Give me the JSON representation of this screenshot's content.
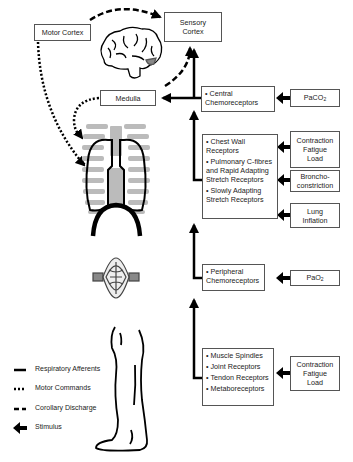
{
  "nodes": {
    "motor_cortex": "Motor Cortex",
    "sensory_cortex": [
      "Sensory",
      "Cortex"
    ],
    "medulla": "Medulla",
    "central_chemoreceptors": [
      "• Central",
      "Chemoreceptors"
    ],
    "paco2": {
      "base": "PaCO",
      "sub": "2"
    },
    "pulmonary_receptors": [
      "• Chest Wall Receptors",
      "• Pulmonary C-fibres and Rapid Adapting Stretch Receptors",
      "• Slowly Adapting Stretch Receptors"
    ],
    "stim_contraction_1": [
      "Contraction",
      "Fatigue",
      "Load"
    ],
    "stim_bronchoconstriction": [
      "Broncho-",
      "constriction"
    ],
    "stim_lung_inflation": [
      "Lung",
      "Inflation"
    ],
    "peripheral_chemoreceptors": [
      "• Peripheral",
      "Chemoreceptors"
    ],
    "pao2": {
      "base": "PaO",
      "sub": "2"
    },
    "muscle_receptors": [
      "• Muscle Spindles",
      "• Joint Receptors",
      "• Tendon Receptors",
      "• Metaboreceptors"
    ],
    "stim_contraction_2": [
      "Contraction",
      "Fatigue",
      "Load"
    ]
  },
  "legend": [
    {
      "style": "solid",
      "label": "Respiratory Afferents"
    },
    {
      "style": "dotted",
      "label": "Motor Commands"
    },
    {
      "style": "dashed",
      "label": "Corollary Discharge"
    },
    {
      "style": "arrow",
      "label": "Stimulus"
    }
  ],
  "illustrations": [
    "brain-icon",
    "ribcage-lungs-icon",
    "diaphragm-icon",
    "leg-icon"
  ],
  "colors": {
    "line": "#000000",
    "box_border": "#555555",
    "illustration_gray": "#b8b8b8"
  }
}
